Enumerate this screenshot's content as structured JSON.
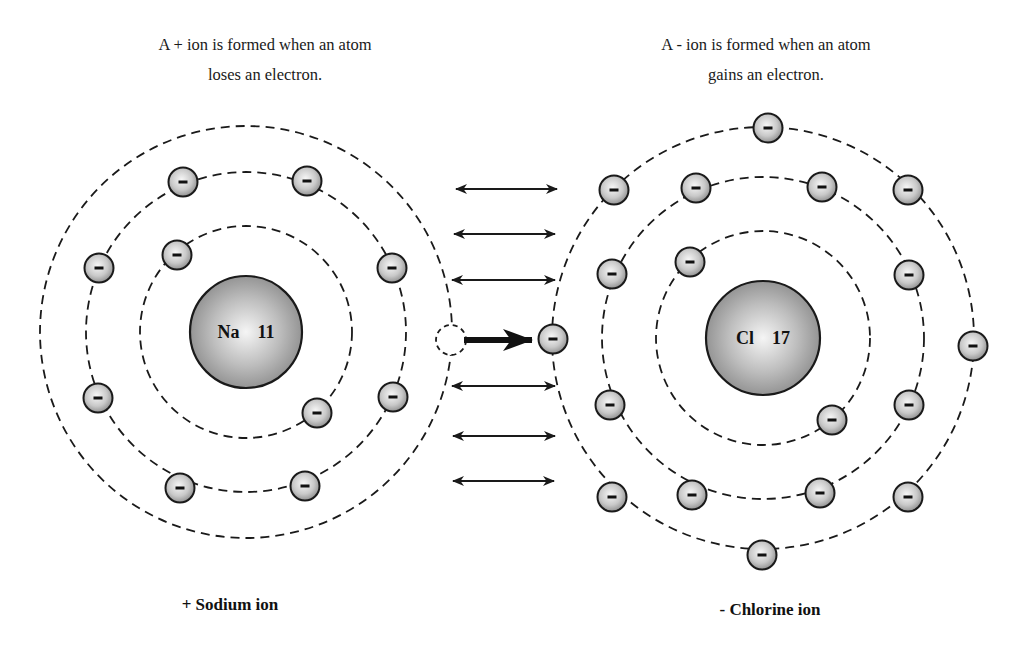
{
  "captions": {
    "left_line1": "A + ion is formed when an atom",
    "left_line2": "loses an electron.",
    "right_line1": "A - ion is formed when an atom",
    "right_line2": "gains an electron."
  },
  "labels": {
    "sodium": "+ Sodium ion",
    "chlorine": "- Chlorine ion"
  },
  "atoms": {
    "sodium": {
      "symbol": "Na",
      "atomic_number": "11",
      "nucleus": {
        "cx": 246,
        "cy": 332,
        "r": 56
      },
      "orbits": [
        106,
        160,
        206
      ],
      "electrons": [
        [
          177,
          255
        ],
        [
          317,
          413
        ],
        [
          183,
          182
        ],
        [
          307,
          181
        ],
        [
          99,
          268
        ],
        [
          392,
          268
        ],
        [
          98,
          398
        ],
        [
          393,
          397
        ],
        [
          180,
          488
        ],
        [
          305,
          486
        ]
      ],
      "lost_electron": [
        451,
        340
      ]
    },
    "chlorine": {
      "symbol": "Cl",
      "atomic_number": "17",
      "nucleus": {
        "cx": 763,
        "cy": 338,
        "r": 57
      },
      "orbits": [
        107,
        161,
        211
      ],
      "electrons": [
        [
          690,
          262
        ],
        [
          832,
          420
        ],
        [
          696,
          188
        ],
        [
          822,
          187
        ],
        [
          612,
          274
        ],
        [
          909,
          275
        ],
        [
          610,
          405
        ],
        [
          909,
          405
        ],
        [
          692,
          495
        ],
        [
          820,
          493
        ],
        [
          768,
          128
        ],
        [
          614,
          190
        ],
        [
          908,
          190
        ],
        [
          553,
          339
        ],
        [
          973,
          346
        ],
        [
          612,
          497
        ],
        [
          908,
          497
        ],
        [
          762,
          555
        ]
      ]
    }
  },
  "attraction_arrows": [
    {
      "x1": 454,
      "x2": 559,
      "y": 189
    },
    {
      "x1": 452,
      "x2": 557,
      "y": 234
    },
    {
      "x1": 450,
      "x2": 557,
      "y": 280
    },
    {
      "x1": 450,
      "x2": 557,
      "y": 386
    },
    {
      "x1": 451,
      "x2": 557,
      "y": 436
    },
    {
      "x1": 451,
      "x2": 556,
      "y": 481
    }
  ],
  "transfer_arrow": {
    "x1": 464,
    "x2": 532,
    "y": 340
  },
  "colors": {
    "line": "#1a1a1a",
    "electron_center": "#f4f4f4",
    "electron_edge": "#9a9a9a",
    "nucleus_center": "#f0f0f0",
    "nucleus_edge": "#8c8c8c"
  }
}
